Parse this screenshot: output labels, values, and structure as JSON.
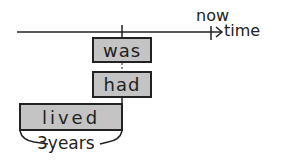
{
  "diagram": {
    "axis": {
      "now_label": "now",
      "time_label": "time"
    },
    "boxes": [
      {
        "id": "was",
        "label": "was"
      },
      {
        "id": "had",
        "label": "had"
      },
      {
        "id": "lived",
        "label": "lived"
      }
    ],
    "duration_label": "3years",
    "colors": {
      "box_fill": "#c4c4c4",
      "stroke": "#222222"
    }
  }
}
